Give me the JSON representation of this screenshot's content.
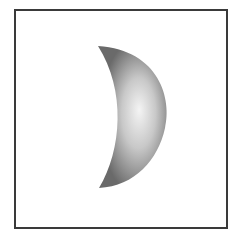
{
  "figure": {
    "shape": "crescent-moon",
    "colors": {
      "border": "#3a3a3a",
      "background": "#ffffff",
      "shade_dark": "#6e6e6e",
      "shade_light": "#f2f2f2"
    }
  }
}
